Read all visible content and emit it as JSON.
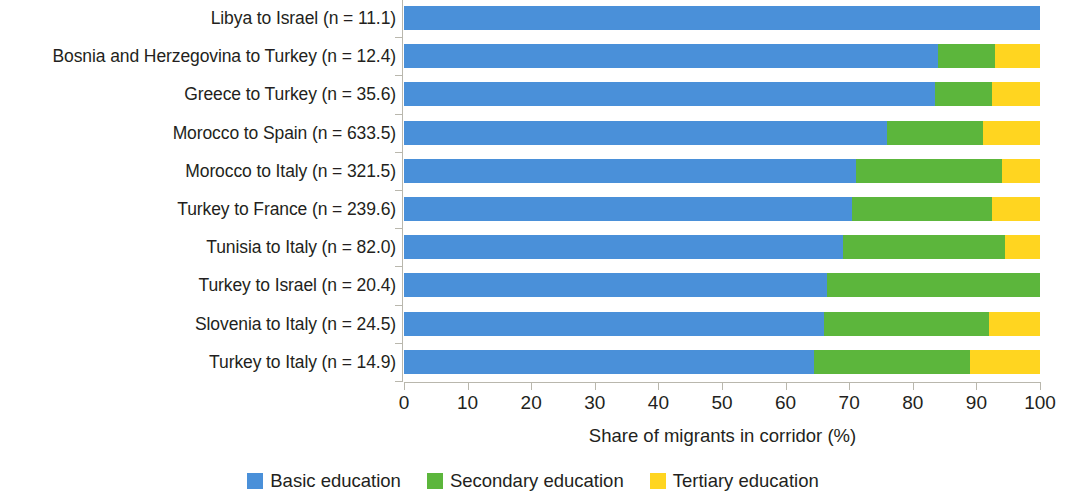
{
  "chart_data": {
    "type": "bar",
    "subtype": "stacked-horizontal-100pct",
    "title": "",
    "xlabel": "Share of migrants in corridor (%)",
    "ylabel": "",
    "xlim": [
      0,
      100
    ],
    "xticks": [
      0,
      10,
      20,
      30,
      40,
      50,
      60,
      70,
      80,
      90,
      100
    ],
    "grid": false,
    "legend_position": "bottom",
    "categories": [
      "Libya to Israel (n = 11.1)",
      "Bosnia and Herzegovina to Turkey (n = 12.4)",
      "Greece to Turkey (n = 35.6)",
      "Morocco to Spain (n = 633.5)",
      "Morocco to Italy (n = 321.5)",
      "Turkey to France (n = 239.6)",
      "Tunisia to Italy (n = 82.0)",
      "Turkey to Israel (n = 20.4)",
      "Slovenia to Italy (n = 24.5)",
      "Turkey to Italy (n = 14.9)"
    ],
    "series": [
      {
        "name": "Basic education",
        "color": "#4a90d9",
        "values": [
          100.0,
          84.0,
          83.5,
          76.0,
          71.0,
          70.5,
          69.0,
          66.5,
          66.0,
          64.5
        ]
      },
      {
        "name": "Secondary education",
        "color": "#5cb63c",
        "values": [
          0.0,
          9.0,
          9.0,
          15.0,
          23.0,
          22.0,
          25.5,
          33.5,
          26.0,
          24.5
        ]
      },
      {
        "name": "Tertiary education",
        "color": "#ffd520",
        "values": [
          0.0,
          7.0,
          7.5,
          9.0,
          6.0,
          7.5,
          5.5,
          0.0,
          8.0,
          11.0
        ]
      }
    ]
  },
  "legend": {
    "items": [
      {
        "label": "Basic education",
        "color": "#4a90d9"
      },
      {
        "label": "Secondary education",
        "color": "#5cb63c"
      },
      {
        "label": "Tertiary education",
        "color": "#ffd520"
      }
    ]
  },
  "axis": {
    "x_title": "Share of migrants in corridor (%)",
    "x_tick_labels": [
      "0",
      "10",
      "20",
      "30",
      "40",
      "50",
      "60",
      "70",
      "80",
      "90",
      "100"
    ]
  }
}
